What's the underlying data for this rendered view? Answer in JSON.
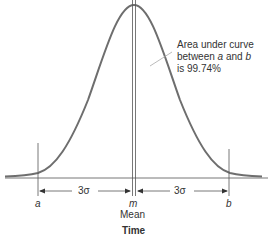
{
  "diagram": {
    "type": "normal-distribution",
    "annotation": {
      "line1": "Area under curve",
      "line2_pre": "between ",
      "line2_a": "a",
      "line2_mid": " and ",
      "line2_b": "b",
      "line3": "is 99.74%"
    },
    "left_span_label": "3σ",
    "right_span_label": "3σ",
    "point_a": "a",
    "point_m": "m",
    "point_b": "b",
    "mean_label": "Mean",
    "axis_label": "Time"
  },
  "colors": {
    "curve": "#6e6e6e",
    "lines": "#555555",
    "text": "#333333"
  }
}
